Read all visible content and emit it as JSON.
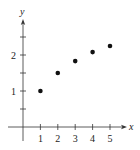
{
  "chart_data": {
    "type": "scatter",
    "title": "",
    "xlabel": "x",
    "ylabel": "y",
    "x": [
      1,
      2,
      3,
      4,
      5
    ],
    "y": [
      1.0,
      1.5,
      1.83,
      2.08,
      2.25
    ],
    "xlim": [
      -0.5,
      5.5
    ],
    "ylim": [
      -0.5,
      2.9
    ],
    "xticks": [
      1,
      2,
      3,
      4,
      5
    ],
    "xtick_labels": [
      "1",
      "2",
      "3",
      "4",
      "5"
    ],
    "yticks": [
      0.5,
      1,
      1.5,
      2,
      2.5
    ],
    "ytick_labels": [
      "",
      "1",
      "",
      "2",
      ""
    ],
    "grid": false,
    "legend": null
  },
  "colors": {
    "axis": "#333333",
    "point": "#111111"
  }
}
